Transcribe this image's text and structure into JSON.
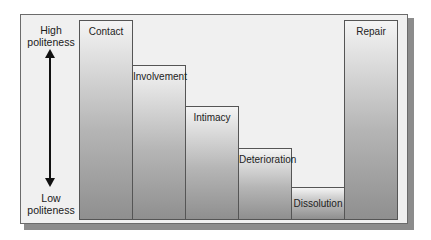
{
  "axis": {
    "top_label_line1": "High",
    "top_label_line2": "politeness",
    "bottom_label_line1": "Low",
    "bottom_label_line2": "politeness"
  },
  "stages": [
    {
      "label": "Contact",
      "level": 1.0
    },
    {
      "label": "Involvement",
      "level": 0.77
    },
    {
      "label": "Intimacy",
      "level": 0.57
    },
    {
      "label": "Deterioration",
      "level": 0.36
    },
    {
      "label": "Dissolution",
      "level": 0.16
    },
    {
      "label": "Repair",
      "level": 1.0
    }
  ]
}
